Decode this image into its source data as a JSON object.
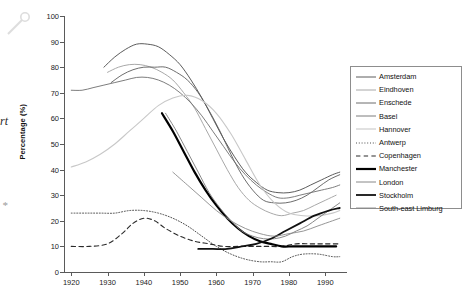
{
  "overlay": {
    "cursor_icon": "magnifier-pin-icon",
    "left_margin_fragment": "rt",
    "left_margin_dot": "*"
  },
  "chart_data": {
    "type": "line",
    "title": "",
    "xlabel": "",
    "ylabel": "Percentage (%)",
    "xlim": [
      1918,
      1996
    ],
    "ylim": [
      0,
      100
    ],
    "grid": false,
    "legend_position": "right",
    "xticks": [
      1920,
      1930,
      1940,
      1950,
      1960,
      1970,
      1980,
      1990
    ],
    "yticks": [
      0,
      10,
      20,
      30,
      40,
      50,
      60,
      70,
      80,
      90,
      100
    ],
    "series": [
      {
        "name": "Amsterdam",
        "style": "solid",
        "color": "#4a4a4a",
        "width": 0.9,
        "x": [
          1929,
          1932,
          1935,
          1938,
          1941,
          1944,
          1947,
          1950,
          1953,
          1956,
          1959,
          1962,
          1965,
          1968,
          1971,
          1974,
          1977,
          1980,
          1983,
          1986,
          1989,
          1992,
          1994
        ],
        "y": [
          80,
          84,
          87,
          89,
          89,
          88,
          85,
          81,
          75,
          68,
          60,
          52,
          45,
          39,
          35,
          32,
          31,
          31,
          32,
          34,
          36,
          38,
          39
        ]
      },
      {
        "name": "Eindhoven",
        "style": "solid",
        "color": "#9e9e9e",
        "width": 0.9,
        "x": [
          1930,
          1933,
          1936,
          1939,
          1942,
          1945,
          1948,
          1951,
          1954,
          1957,
          1960,
          1963,
          1966,
          1969,
          1972,
          1975,
          1978,
          1981,
          1984,
          1987,
          1990,
          1993
        ],
        "y": [
          78,
          80,
          81,
          81,
          80,
          78,
          75,
          70,
          64,
          56,
          48,
          40,
          33,
          28,
          25,
          23,
          22,
          23,
          24,
          26,
          28,
          30
        ]
      },
      {
        "name": "Enschede",
        "style": "solid",
        "color": "#5c5c5c",
        "width": 0.9,
        "x": [
          1931,
          1934,
          1937,
          1940,
          1943,
          1946,
          1949,
          1952,
          1955,
          1958,
          1961,
          1964,
          1967,
          1970,
          1973,
          1976,
          1979,
          1982,
          1985,
          1988,
          1991,
          1994
        ],
        "y": [
          74,
          77,
          79,
          80,
          80,
          80,
          78,
          75,
          70,
          63,
          55,
          46,
          38,
          32,
          28,
          27,
          27,
          28,
          30,
          33,
          36,
          38
        ]
      },
      {
        "name": "Basel",
        "style": "solid",
        "color": "#6e6e6e",
        "width": 0.9,
        "x": [
          1920,
          1923,
          1926,
          1929,
          1932,
          1935,
          1938,
          1941,
          1944,
          1947,
          1950,
          1953,
          1956,
          1959,
          1962,
          1965,
          1968,
          1971,
          1974,
          1977,
          1980,
          1983,
          1986,
          1989,
          1992,
          1994
        ],
        "y": [
          71,
          71,
          72,
          73,
          74,
          75,
          76,
          76,
          75,
          73,
          70,
          66,
          61,
          55,
          49,
          43,
          38,
          34,
          31,
          29,
          29,
          30,
          31,
          32,
          33,
          34
        ]
      },
      {
        "name": "Hannover",
        "style": "solid",
        "color": "#c8c8c8",
        "width": 1.1,
        "x": [
          1920,
          1924,
          1928,
          1932,
          1936,
          1940,
          1944,
          1948,
          1952,
          1956,
          1960,
          1964,
          1968,
          1972,
          1976,
          1980,
          1984,
          1988,
          1992,
          1994
        ],
        "y": [
          41,
          43,
          46,
          50,
          55,
          60,
          65,
          68,
          69,
          67,
          62,
          54,
          44,
          34,
          27,
          23,
          22,
          22,
          23,
          24
        ]
      },
      {
        "name": "Antwerp",
        "style": "dotted",
        "color": "#3a3a3a",
        "width": 0.9,
        "x": [
          1920,
          1924,
          1928,
          1932,
          1936,
          1940,
          1944,
          1948,
          1952,
          1956,
          1960,
          1964,
          1968,
          1972,
          1975,
          1978,
          1981,
          1984,
          1988,
          1992,
          1994
        ],
        "y": [
          23,
          23,
          23,
          23,
          24,
          24,
          23,
          21,
          18,
          14,
          10,
          7,
          5,
          4,
          4,
          4,
          6,
          7,
          7,
          6,
          6
        ]
      },
      {
        "name": "Copenhagen",
        "style": "dashed",
        "color": "#2a2a2a",
        "width": 1.1,
        "x": [
          1920,
          1925,
          1930,
          1934,
          1937,
          1940,
          1943,
          1946,
          1950,
          1954,
          1958,
          1962,
          1966,
          1970,
          1974,
          1978,
          1982,
          1986,
          1990,
          1994
        ],
        "y": [
          10,
          10,
          11,
          15,
          19,
          21,
          20,
          17,
          14,
          12,
          11,
          10,
          10,
          10,
          10,
          10,
          11,
          11,
          11,
          11
        ]
      },
      {
        "name": "Manchester",
        "style": "solid",
        "color": "#000000",
        "width": 2.2,
        "x": [
          1945,
          1948,
          1951,
          1954,
          1957,
          1960,
          1963,
          1966,
          1969,
          1972,
          1975,
          1978,
          1981,
          1984,
          1987,
          1990,
          1993
        ],
        "y": [
          62,
          55,
          47,
          39,
          32,
          26,
          21,
          17,
          14,
          12,
          11,
          10,
          10,
          10,
          10,
          10,
          10
        ]
      },
      {
        "name": "London",
        "style": "solid",
        "color": "#7a7a7a",
        "width": 0.9,
        "x": [
          1946,
          1949,
          1952,
          1955,
          1958,
          1961,
          1964,
          1967,
          1970,
          1973,
          1976,
          1979,
          1982,
          1985,
          1988,
          1991,
          1994
        ],
        "y": [
          62,
          55,
          47,
          39,
          31,
          25,
          20,
          16,
          14,
          13,
          13,
          14,
          16,
          18,
          21,
          24,
          27
        ]
      },
      {
        "name": "Stockholm",
        "style": "solid",
        "color": "#111111",
        "width": 1.8,
        "x": [
          1955,
          1959,
          1963,
          1967,
          1971,
          1975,
          1979,
          1983,
          1987,
          1991,
          1994
        ],
        "y": [
          9,
          9,
          9,
          10,
          11,
          13,
          16,
          19,
          22,
          24,
          25
        ]
      },
      {
        "name": "South-east Limburg",
        "style": "solid",
        "color": "#8a8a8a",
        "width": 0.9,
        "x": [
          1948,
          1952,
          1956,
          1960,
          1964,
          1968,
          1972,
          1976,
          1980,
          1984,
          1988,
          1992,
          1994
        ],
        "y": [
          39,
          34,
          29,
          24,
          20,
          17,
          15,
          14,
          15,
          16,
          18,
          20,
          21
        ]
      }
    ]
  },
  "legend": {
    "items": [
      {
        "label": "Amsterdam"
      },
      {
        "label": "Eindhoven"
      },
      {
        "label": "Enschede"
      },
      {
        "label": "Basel"
      },
      {
        "label": "Hannover"
      },
      {
        "label": "Antwerp"
      },
      {
        "label": "Copenhagen"
      },
      {
        "label": "Manchester"
      },
      {
        "label": "London"
      },
      {
        "label": "Stockholm"
      },
      {
        "label": "South-east Limburg"
      }
    ]
  }
}
